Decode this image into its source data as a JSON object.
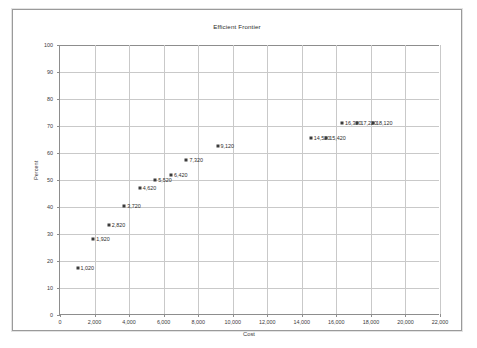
{
  "chart_data": {
    "type": "scatter",
    "title": "Efficient Frontier",
    "xlabel": "Cost",
    "ylabel": "Percent",
    "xlim": [
      0,
      22000
    ],
    "ylim": [
      0,
      100
    ],
    "xticks": [
      "0",
      "2,000",
      "4,000",
      "6,000",
      "8,000",
      "10,000",
      "12,000",
      "14,000",
      "16,000",
      "18,000",
      "20,000",
      "22,000"
    ],
    "xtick_values": [
      0,
      2000,
      4000,
      6000,
      8000,
      10000,
      12000,
      14000,
      16000,
      18000,
      20000,
      22000
    ],
    "yticks": [
      "0",
      "10",
      "20",
      "30",
      "40",
      "50",
      "60",
      "70",
      "80",
      "90",
      "100"
    ],
    "ytick_values": [
      0,
      10,
      20,
      30,
      40,
      50,
      60,
      70,
      80,
      90,
      100
    ],
    "grid": true,
    "legend": "none",
    "marker_color": "#3b3b3b",
    "grid_color": "#c9c9c9",
    "axis_color": "#8d8d8d",
    "points": [
      {
        "label": "1,020",
        "x": 1020,
        "y": 17.5
      },
      {
        "label": "1,920",
        "x": 1920,
        "y": 28.0
      },
      {
        "label": "2,820",
        "x": 2820,
        "y": 33.5
      },
      {
        "label": "3,720",
        "x": 3720,
        "y": 40.5
      },
      {
        "label": "4,620",
        "x": 4620,
        "y": 47.0
      },
      {
        "label": "5,520",
        "x": 5520,
        "y": 50.0
      },
      {
        "label": "6,420",
        "x": 6420,
        "y": 52.0
      },
      {
        "label": "7,320",
        "x": 7320,
        "y": 57.5
      },
      {
        "label": "9,120",
        "x": 9120,
        "y": 62.5
      },
      {
        "label": "14,520",
        "x": 14520,
        "y": 65.5
      },
      {
        "label": "15,420",
        "x": 15420,
        "y": 65.5
      },
      {
        "label": "16,320",
        "x": 16320,
        "y": 71.0
      },
      {
        "label": "17,220",
        "x": 17220,
        "y": 71.0
      },
      {
        "label": "18,120",
        "x": 18120,
        "y": 71.0
      }
    ]
  }
}
